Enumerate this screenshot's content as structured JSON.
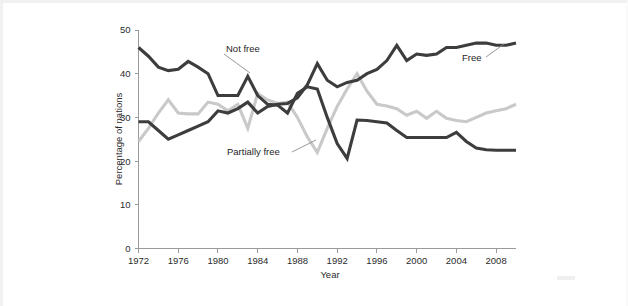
{
  "figure": {
    "background_color": "#ffffff",
    "frame_color": "#f1f1f1"
  },
  "chart_data": {
    "type": "line",
    "title": "",
    "subtitle": "",
    "xlabel": "Year",
    "ylabel": "Percentage of nations",
    "xlim": [
      1972,
      2010
    ],
    "ylim": [
      0,
      50
    ],
    "grid": false,
    "legend_position": "inline-annotations",
    "xticks": [
      1972,
      1976,
      1980,
      1984,
      1988,
      1992,
      1996,
      2000,
      2004,
      2008
    ],
    "xtick_labels": [
      "1972",
      "1976",
      "1980",
      "1984",
      "1988",
      "1992",
      "1996",
      "2000",
      "2004",
      "2008"
    ],
    "yticks": [
      0,
      10,
      20,
      30,
      40,
      50
    ],
    "ytick_labels": [
      "0",
      "10",
      "20",
      "30",
      "40",
      "50"
    ],
    "x": [
      1972,
      1973,
      1974,
      1975,
      1976,
      1977,
      1978,
      1979,
      1980,
      1981,
      1982,
      1983,
      1984,
      1985,
      1986,
      1987,
      1988,
      1989,
      1990,
      1991,
      1992,
      1993,
      1994,
      1995,
      1996,
      1997,
      1998,
      1999,
      2000,
      2001,
      2002,
      2003,
      2004,
      2005,
      2006,
      2007,
      2008,
      2009,
      2010
    ],
    "series": [
      {
        "name": "Not free",
        "color": "#3d3d3d",
        "label": "Not free",
        "values": [
          46.0,
          44.0,
          41.5,
          40.7,
          41.0,
          42.8,
          41.5,
          40.0,
          35.0,
          35.0,
          35.0,
          39.4,
          35.0,
          33.0,
          32.8,
          31.0,
          35.5,
          37.0,
          36.5,
          30.0,
          24.0,
          20.6,
          29.4,
          29.3,
          29.0,
          28.7,
          27.0,
          25.4,
          25.4,
          25.4,
          25.4,
          25.4,
          26.6,
          24.5,
          23.0,
          22.6,
          22.5,
          22.5,
          22.5
        ]
      },
      {
        "name": "Partially free",
        "color": "#c9c9c9",
        "label": "Partially free",
        "values": [
          24.5,
          27.5,
          31.0,
          34.0,
          31.0,
          30.8,
          30.8,
          33.5,
          33.0,
          31.5,
          33.0,
          27.5,
          35.5,
          34.0,
          33.2,
          33.5,
          30.0,
          25.5,
          22.0,
          27.5,
          32.5,
          36.5,
          40.0,
          36.0,
          33.0,
          32.6,
          32.0,
          30.5,
          31.4,
          29.8,
          31.4,
          29.8,
          29.3,
          29.0,
          30.0,
          31.0,
          31.5,
          32.0,
          33.0
        ]
      },
      {
        "name": "Free",
        "color": "#3d3d3d",
        "label": "Free",
        "values": [
          29.0,
          29.0,
          27.0,
          25.0,
          26.0,
          27.0,
          28.0,
          29.0,
          31.5,
          31.0,
          32.0,
          33.5,
          31.0,
          32.5,
          33.0,
          33.2,
          34.5,
          37.5,
          42.3,
          38.5,
          37.0,
          38.0,
          38.5,
          40.0,
          41.0,
          43.0,
          46.5,
          43.0,
          44.5,
          44.2,
          44.5,
          46.0,
          46.0,
          46.5,
          47.0,
          47.0,
          46.5,
          46.5,
          47.0
        ]
      }
    ]
  }
}
